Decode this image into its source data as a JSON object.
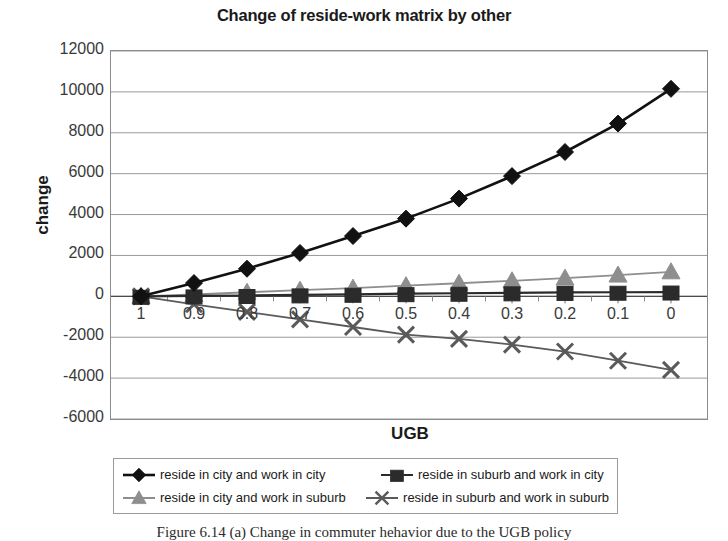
{
  "chart_data": {
    "type": "line",
    "title": "Change of reside-work matrix by other",
    "xlabel": "UGB",
    "ylabel": "change",
    "grid": true,
    "legend_position": "bottom",
    "ylim": [
      -6000,
      12000
    ],
    "ytick_labels": [
      "12000",
      "10000",
      "8000",
      "6000",
      "4000",
      "2000",
      "0",
      "-2000",
      "-4000",
      "-6000"
    ],
    "ytick_values": [
      12000,
      10000,
      8000,
      6000,
      4000,
      2000,
      0,
      -2000,
      -4000,
      -6000
    ],
    "categories": [
      "1",
      "0.9",
      "0.8",
      "0.7",
      "0.6",
      "0.5",
      "0.4",
      "0.3",
      "0.2",
      "0.1",
      "0"
    ],
    "series": [
      {
        "name": "reside in city and work in city",
        "marker": "diamond",
        "color": "#111111",
        "line_color": "#111111",
        "values": [
          0,
          650,
          1350,
          2120,
          2950,
          3800,
          4780,
          5880,
          7060,
          8450,
          10150
        ]
      },
      {
        "name": "reside in suburb and work in city",
        "marker": "square",
        "color": "#2b2b2b",
        "line_color": "#2b2b2b",
        "values": [
          0,
          20,
          40,
          70,
          100,
          130,
          150,
          170,
          190,
          200,
          210
        ]
      },
      {
        "name": "reside in city and work in suburb",
        "marker": "triangle",
        "color": "#8e8e8e",
        "line_color": "#8e8e8e",
        "values": [
          0,
          90,
          200,
          300,
          400,
          520,
          640,
          760,
          890,
          1040,
          1200
        ]
      },
      {
        "name": "reside in suburb and work in suburb",
        "marker": "cross",
        "color": "#5a5a5a",
        "line_color": "#5a5a5a",
        "values": [
          0,
          -390,
          -760,
          -1130,
          -1500,
          -1870,
          -2080,
          -2360,
          -2700,
          -3150,
          -3600
        ]
      }
    ]
  },
  "caption": {
    "text": "Figure 6.14 (a) Change in commuter hehavior due to the UGB policy"
  }
}
